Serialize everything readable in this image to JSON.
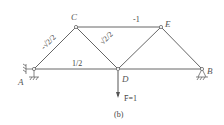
{
  "figure": {
    "caption": "(b)",
    "nodes": {
      "A": {
        "label": "A",
        "x": 34,
        "y": 69
      },
      "C": {
        "label": "C",
        "x": 76,
        "y": 27
      },
      "E": {
        "label": "E",
        "x": 161,
        "y": 27
      },
      "D": {
        "label": "D",
        "x": 118,
        "y": 69
      },
      "B": {
        "label": "B",
        "x": 202,
        "y": 69
      }
    },
    "members": {
      "AC": {
        "force": "-√2/2"
      },
      "CE": {
        "force": "-1"
      },
      "AD": {
        "force": "1/2"
      },
      "CD": {
        "force": "√2/2"
      }
    },
    "load": {
      "label": "F̄=1",
      "at": "D",
      "direction": "down"
    },
    "colors": {
      "line": "#555555",
      "text": "#444444"
    }
  }
}
